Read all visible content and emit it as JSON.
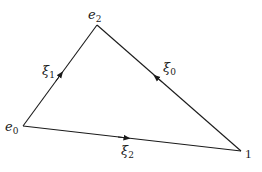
{
  "diagram": {
    "type": "oriented-triangle",
    "vertices": [
      {
        "id": "e0",
        "label": "e",
        "sub": "0",
        "x": 23,
        "y": 126
      },
      {
        "id": "e2",
        "label": "e",
        "sub": "2",
        "x": 97,
        "y": 25
      },
      {
        "id": "one",
        "label": "1",
        "x": 241,
        "y": 151
      }
    ],
    "edges": [
      {
        "id": "xi1",
        "from": "e0",
        "to": "e2",
        "label": "ξ",
        "sub": "1",
        "arrow": "toward e2"
      },
      {
        "id": "xi0",
        "from": "one",
        "to": "e2",
        "label": "ξ",
        "sub": "0",
        "arrow": "toward e2"
      },
      {
        "id": "xi2",
        "from": "e0",
        "to": "one",
        "label": "ξ",
        "sub": "2",
        "arrow": "toward 1"
      }
    ],
    "colors": {
      "stroke": "#1a1a1a",
      "background": "#ffffff"
    }
  }
}
